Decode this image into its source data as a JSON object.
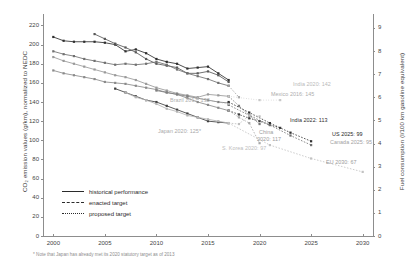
{
  "chart_data": {
    "type": "line",
    "title": "",
    "xlabel": "",
    "ylabel": "CO₂ emission values (g/km), normalized to NEDC",
    "ylabel_right": "Fuel consumption (l/100 km gasoline equivalent)",
    "xlim": [
      1999,
      2031
    ],
    "ylim": [
      0,
      232
    ],
    "ylim_right": [
      0,
      9.6
    ],
    "xticks": [
      "2000",
      "2005",
      "2010",
      "2015",
      "2020",
      "2025",
      "2030"
    ],
    "xtick_values": [
      2000,
      2005,
      2010,
      2015,
      2020,
      2025,
      2030
    ],
    "yticks": [
      "0",
      "20",
      "40",
      "60",
      "80",
      "100",
      "120",
      "140",
      "160",
      "180",
      "200",
      "220"
    ],
    "ytick_values": [
      0,
      20,
      40,
      60,
      80,
      100,
      120,
      140,
      160,
      180,
      200,
      220
    ],
    "yticks_right": [
      "0",
      "1",
      "2",
      "3",
      "4",
      "5",
      "6",
      "7",
      "8",
      "9"
    ],
    "ytick_right_values": [
      0,
      1,
      2,
      3,
      4,
      5,
      6,
      7,
      8,
      9
    ],
    "grid": false,
    "legend_position": "lower-left",
    "series": [
      {
        "name": "US",
        "kind": "historical",
        "color": "#2f2f2f",
        "x": [
          2000,
          2001,
          2002,
          2003,
          2004,
          2005,
          2006,
          2007,
          2008,
          2009,
          2010,
          2011,
          2012,
          2013,
          2014,
          2015,
          2016,
          2017
        ],
        "y": [
          208,
          204,
          203,
          203,
          203,
          202,
          200,
          193,
          195,
          191,
          185,
          182,
          180,
          175,
          176,
          177,
          170,
          163
        ]
      },
      {
        "name": "Canada",
        "kind": "historical",
        "color": "#585858",
        "x": [
          2004,
          2005,
          2006,
          2007,
          2008,
          2009,
          2010,
          2011,
          2012,
          2013,
          2014,
          2015,
          2016,
          2017
        ],
        "y": [
          211,
          206,
          201,
          197,
          192,
          185,
          180,
          178,
          176,
          170,
          170,
          172,
          168,
          161
        ]
      },
      {
        "name": "Mexico",
        "kind": "historical",
        "color": "#707070",
        "x": [
          2000,
          2001,
          2002,
          2003,
          2004,
          2005,
          2006,
          2007,
          2008,
          2009,
          2010,
          2011,
          2012,
          2013,
          2014,
          2015,
          2016,
          2017
        ],
        "y": [
          193,
          190,
          188,
          185,
          183,
          181,
          179,
          180,
          179,
          180,
          182,
          179,
          174,
          170,
          167,
          164,
          160,
          157
        ]
      },
      {
        "name": "China",
        "kind": "historical",
        "color": "#9a9a9a",
        "x": [
          2000,
          2001,
          2002,
          2003,
          2004,
          2005,
          2006,
          2007,
          2008,
          2009,
          2010,
          2011,
          2012,
          2013,
          2014,
          2015,
          2016,
          2017
        ],
        "y": [
          187,
          183,
          180,
          177,
          174,
          171,
          168,
          166,
          163,
          159,
          155,
          152,
          149,
          147,
          145,
          148,
          147,
          146
        ]
      },
      {
        "name": "S. Korea",
        "kind": "historical",
        "color": "#8a8a8a",
        "x": [
          2000,
          2001,
          2002,
          2003,
          2004,
          2005,
          2006,
          2007,
          2008,
          2009,
          2010,
          2011,
          2012,
          2013,
          2014,
          2015,
          2016,
          2017
        ],
        "y": [
          173,
          170,
          168,
          166,
          164,
          161,
          160,
          159,
          157,
          155,
          153,
          150,
          148,
          144,
          140,
          137,
          134,
          131
        ]
      },
      {
        "name": "EU",
        "kind": "historical",
        "color": "#3f3f3f",
        "x": [
          2006,
          2007,
          2008,
          2009,
          2010,
          2011,
          2012,
          2013,
          2014,
          2015,
          2016,
          2017
        ],
        "y": [
          154,
          150,
          146,
          142,
          140,
          136,
          132,
          128,
          124,
          120,
          119,
          118
        ]
      },
      {
        "name": "Japan",
        "kind": "historical",
        "color": "#b5b5b5",
        "x": [
          2007,
          2008,
          2009,
          2010,
          2011,
          2012,
          2013,
          2014,
          2015,
          2016,
          2017
        ],
        "y": [
          150,
          145,
          142,
          138,
          133,
          130,
          126,
          124,
          122,
          120,
          118
        ]
      },
      {
        "name": "Brazil",
        "kind": "historical",
        "color": "#808080",
        "x": [
          2010,
          2011,
          2012,
          2013,
          2014,
          2015,
          2016,
          2017
        ],
        "y": [
          152,
          150,
          148,
          146,
          144,
          142,
          140,
          139
        ]
      },
      {
        "name": "India",
        "kind": "enacted",
        "color": "#3a3a3a",
        "x": [
          2017,
          2018,
          2019,
          2020,
          2021,
          2022
        ],
        "y": [
          131,
          127,
          123,
          120,
          116,
          113
        ]
      },
      {
        "name": "US target",
        "kind": "enacted",
        "color": "#2f2f2f",
        "x": [
          2017,
          2019,
          2021,
          2023,
          2025
        ],
        "y": [
          140,
          129,
          118,
          108,
          99
        ]
      },
      {
        "name": "Canada target",
        "kind": "enacted",
        "color": "#6f6f6f",
        "x": [
          2017,
          2019,
          2021,
          2023,
          2025
        ],
        "y": [
          137,
          126,
          116,
          105,
          95
        ]
      },
      {
        "name": "China target",
        "kind": "enacted",
        "color": "#787878",
        "x": [
          2017,
          2018,
          2019,
          2020
        ],
        "y": [
          146,
          136,
          126,
          117
        ]
      },
      {
        "name": "S. Korea target",
        "kind": "enacted",
        "color": "#a8a8a8",
        "x": [
          2017,
          2018,
          2019,
          2020
        ],
        "y": [
          131,
          124,
          118,
          97
        ]
      },
      {
        "name": "Japan target",
        "kind": "enacted",
        "color": "#bdbdbd",
        "x": [
          2017,
          2018,
          2019,
          2020
        ],
        "y": [
          118,
          117,
          126,
          125
        ]
      },
      {
        "name": "Mexico target",
        "kind": "enacted",
        "color": "#a0a0a0",
        "x": [
          2017,
          2018
        ],
        "y": [
          157,
          145
        ]
      },
      {
        "name": "EU target",
        "kind": "enacted",
        "color": "#c2c2c2",
        "x": [
          2017,
          2021,
          2025,
          2030
        ],
        "y": [
          118,
          95,
          81,
          67
        ]
      },
      {
        "name": "Brazil target",
        "kind": "proposed",
        "color": "#b0b0b0",
        "x": [
          2014,
          2017
        ],
        "y": [
          144,
          138
        ]
      },
      {
        "name": "India proposed",
        "kind": "proposed",
        "color": "#c8c8c8",
        "x": [
          2017,
          2020,
          2022
        ],
        "y": [
          146,
          142,
          142
        ]
      }
    ],
    "annotations": [
      {
        "text": "India 2020: 142",
        "x": 293,
        "y": 81,
        "color": "#b9b9b9"
      },
      {
        "text": "Mexico 2016: 145",
        "x": 271,
        "y": 91,
        "color": "#adadad"
      },
      {
        "text": "Brazil 2017: 138",
        "x": 170,
        "y": 97,
        "color": "#b0b0b0"
      },
      {
        "text": "Japan 2020: 125*",
        "x": 158,
        "y": 128,
        "color": "#a9a9a9"
      },
      {
        "text": "India 2022: 113",
        "x": 290,
        "y": 117,
        "color": "#2e2e2e"
      },
      {
        "text": "China",
        "x": 259,
        "y": 129,
        "color": "#9c9c9c"
      },
      {
        "text": "2020: 117",
        "x": 257,
        "y": 136,
        "color": "#9c9c9c"
      },
      {
        "text": "S. Korea 2020: 97",
        "x": 222,
        "y": 145,
        "color": "#bdbdbd"
      },
      {
        "text": "US 2025: 99",
        "x": 332,
        "y": 131,
        "color": "#1f1f1f"
      },
      {
        "text": "Canada 2025: 95",
        "x": 330,
        "y": 139,
        "color": "#a2a2a2"
      },
      {
        "text": "EU 2030: 67",
        "x": 326,
        "y": 159,
        "color": "#9b9b9b"
      }
    ],
    "legend": [
      {
        "label": "historical performance",
        "style": "solid"
      },
      {
        "label": "enacted target",
        "style": "dashed"
      },
      {
        "label": "proposed target",
        "style": "dotted"
      }
    ],
    "footnote": "* Note that Japan has already met its 2020 statutory target as of 2013"
  }
}
